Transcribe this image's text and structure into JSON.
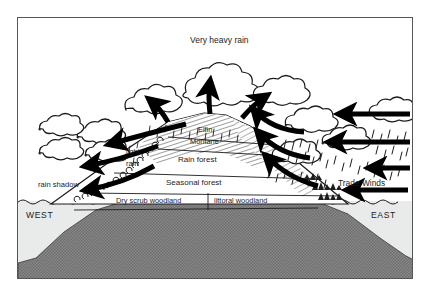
{
  "figure": {
    "frame_color": "#55565a",
    "background": "#ffffff"
  },
  "colors": {
    "ink": "#1c1c1c",
    "sea": "#e9eaea",
    "bedrock": "#7b7b7b",
    "frame": "#55565a",
    "white": "#ffffff"
  },
  "annotations": {
    "very_heavy_rain": "Very heavy rain",
    "light_rain_line1": "light",
    "light_rain_line2": "rain",
    "rain_shadow": "rain shadow",
    "trade_winds": "Trade Winds"
  },
  "directions": {
    "west": "WEST",
    "east": "EAST"
  },
  "vegetation_zones": [
    {
      "id": "elfin",
      "label": "Elfin"
    },
    {
      "id": "montane",
      "label": "Montane"
    },
    {
      "id": "rain-forest",
      "label": "Rain forest"
    },
    {
      "id": "seasonal-forest",
      "label": "Seasonal forest"
    },
    {
      "id": "dry-scrub",
      "label": "Dry scrub woodland"
    },
    {
      "id": "littoral",
      "label": "littoral woodland"
    }
  ],
  "wind_arrows": {
    "trade_wind_inflow_count": 4,
    "summit_updraft_count": 3,
    "lee_descent_count": 3,
    "direction_inflow": "east-to-west",
    "direction_lee": "westward-descending"
  },
  "rain": {
    "windward_side": "east",
    "leeward_side": "west",
    "windward_intensity": "heavy",
    "leeward_intensity": "light"
  }
}
